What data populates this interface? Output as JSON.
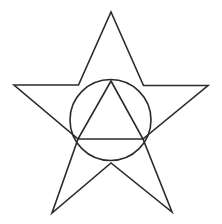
{
  "figure": {
    "background_color": "#ffffff",
    "stroke_color": "#2b2b2b",
    "stroke_width": 1.6,
    "canvas": {
      "width": 222,
      "height": 224
    },
    "shapes": {
      "star": {
        "name": "five-pointed-star",
        "points_count": 5,
        "outer_points": [
          {
            "label": "top",
            "x": 111,
            "y": 12
          },
          {
            "label": "right",
            "x": 208,
            "y": 85.5
          },
          {
            "label": "bottom-right",
            "x": 172,
            "y": 212
          },
          {
            "label": "bottom-left",
            "x": 52,
            "y": 213
          },
          {
            "label": "left",
            "x": 14,
            "y": 85
          }
        ],
        "inner_points": [
          {
            "label": "upper-right",
            "x": 143.5,
            "y": 85.5
          },
          {
            "label": "lower-right",
            "x": 143,
            "y": 139
          },
          {
            "label": "bottom",
            "x": 111,
            "y": 163
          },
          {
            "label": "lower-left",
            "x": 78,
            "y": 139
          },
          {
            "label": "upper-left",
            "x": 78.5,
            "y": 85
          }
        ],
        "path": "M 111 12 L 143.5 85.5 L 208 85.5 L 143 139 L 172 212 L 111 163 L 52 213 L 78 139 L 14 85 L 78.5 85 Z"
      },
      "circle": {
        "name": "inscribed-circle",
        "center_x": 110.5,
        "center_y": 120,
        "radius": 40.5
      },
      "triangle": {
        "name": "inscribed-triangle",
        "vertices": [
          {
            "label": "apex",
            "x": 111,
            "y": 81
          },
          {
            "label": "base-right",
            "x": 143,
            "y": 139
          },
          {
            "label": "base-left",
            "x": 78,
            "y": 139
          }
        ],
        "path": "M 111 81 L 143 139 L 78 139 Z"
      }
    }
  }
}
